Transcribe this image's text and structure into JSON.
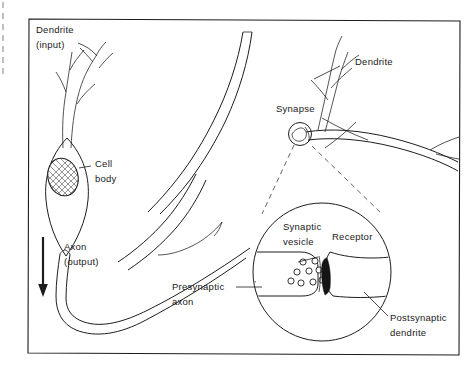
{
  "figure": {
    "background_color": "#ffffff",
    "ink_color": "#1d1d1d",
    "frame": {
      "x": 28,
      "y": 19,
      "width": 432,
      "height": 336
    }
  },
  "labels": {
    "dendrite_input_line1": "Dendrite",
    "dendrite_input_line2": "(input)",
    "cell_body_line1": "Cell",
    "cell_body_line2": "body",
    "axon_output_line1": "Axon",
    "axon_output_line2": "(output)",
    "dendrite_right": "Dendrite",
    "synapse": "Synapse",
    "synaptic_vesicle_line1": "Synaptic",
    "synaptic_vesicle_line2": "vesicle",
    "receptor": "Receptor",
    "presynaptic_axon_line1": "Presynaptic",
    "presynaptic_axon_line2": "axon",
    "postsynaptic_dendrite_line1": "Postsynaptic",
    "postsynaptic_dendrite_line2": "dendrite"
  },
  "structures": {
    "soma": {
      "name": "cell-body",
      "center_x": 67,
      "center_y": 185
    },
    "nucleus": {
      "name": "nucleus",
      "center_x": 63,
      "center_y": 177,
      "shading": "cross-hatch"
    },
    "synapse_marker": {
      "name": "synapse-circle",
      "center_x": 300,
      "center_y": 134,
      "radius": 11
    },
    "magnified_inset": {
      "name": "synapse-magnified-circle",
      "center_x": 322,
      "center_y": 272,
      "radius": 69
    },
    "synaptic_vesicle_count": 9,
    "flow_arrow_direction": "down"
  }
}
